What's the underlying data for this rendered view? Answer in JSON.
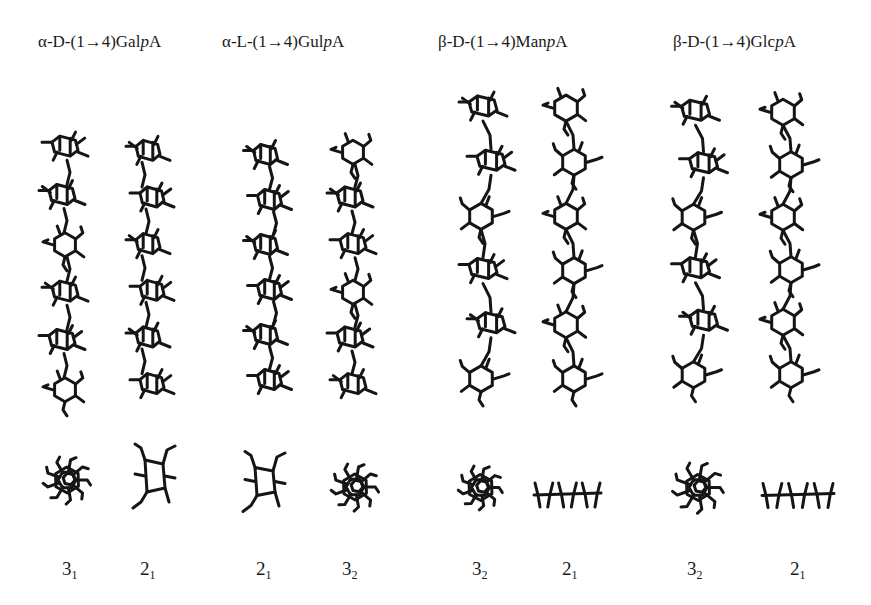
{
  "figure": {
    "panels": [
      {
        "id": "galpa",
        "title_prefix": "α-D-(1→4)Gal",
        "title_italic": "p",
        "title_suffix": "A",
        "helices": [
          {
            "fold": "3",
            "sub": "1",
            "side_view": "3-fold helix, 6 residues",
            "end_view": "star-shaped cluster"
          },
          {
            "fold": "2",
            "sub": "1",
            "side_view": "2-fold helix, 6 residues",
            "end_view": "ribbon"
          }
        ]
      },
      {
        "id": "gulpa",
        "title_prefix": "α-L-(1→4)Gul",
        "title_italic": "p",
        "title_suffix": "A",
        "helices": [
          {
            "fold": "2",
            "sub": "1",
            "side_view": "2-fold helix, 6 residues",
            "end_view": "ribbon"
          },
          {
            "fold": "3",
            "sub": "2",
            "side_view": "3-fold helix, 6 residues",
            "end_view": "star-shaped cluster"
          }
        ]
      },
      {
        "id": "manpa",
        "title_prefix": "β-D-(1→4)Man",
        "title_italic": "p",
        "title_suffix": "A",
        "helices": [
          {
            "fold": "3",
            "sub": "2",
            "side_view": "3-fold helix, 6 residues",
            "end_view": "star-shaped cluster"
          },
          {
            "fold": "2",
            "sub": "1",
            "side_view": "2-fold helix, 6 residues",
            "end_view": "flat ribbon"
          }
        ]
      },
      {
        "id": "glcpa",
        "title_prefix": "β-D-(1→4)Glc",
        "title_italic": "p",
        "title_suffix": "A",
        "helices": [
          {
            "fold": "3",
            "sub": "2",
            "side_view": "3-fold helix, 6 residues",
            "end_view": "star-shaped cluster"
          },
          {
            "fold": "2",
            "sub": "1",
            "side_view": "2-fold helix, 6 residues",
            "end_view": "flat ribbon"
          }
        ]
      }
    ]
  }
}
